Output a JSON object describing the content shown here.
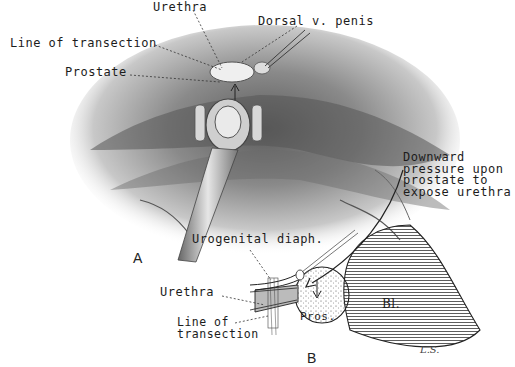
{
  "figure": {
    "panels": [
      {
        "id": "A",
        "letter": "A",
        "description": "Surgical field view with sound in urethra; prostate retracted",
        "labels": {
          "urethra": "Urethra",
          "dorsal_vein": "Dorsal v. penis",
          "line_of_transection": "Line of transection",
          "prostate": "Prostate"
        }
      },
      {
        "id": "B",
        "letter": "B",
        "description": "Schematic sagittal diagram of prostate, urethra and bladder",
        "labels": {
          "urogenital_diaphragm": "Urogenital diaph.",
          "urethra": "Urethra",
          "line_of_transection": "Line of\ntransection",
          "prostate_abbrev": "Pros.",
          "bladder_abbrev": "Bl.",
          "annotation": "Downward\npressure upon\nprostate to\nexpose urethra"
        }
      }
    ],
    "artist_signature": "L.S.",
    "colors": {
      "background": "#ffffff",
      "ink": "#1a1a1a",
      "shading": "#7a7a7a"
    }
  }
}
